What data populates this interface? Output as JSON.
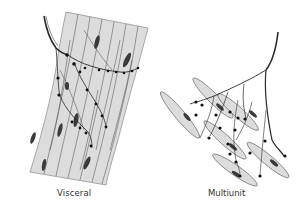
{
  "figure": {
    "panels": [
      {
        "id": "visceral",
        "caption": "Visceral",
        "description": "Sheet of closely packed spindle-shaped smooth muscle fibers with a branching nerve fiber bearing varicosities running across many fibers"
      },
      {
        "id": "multiunit",
        "caption": "Multiunit",
        "description": "Separate discrete smooth muscle fibers each innervated individually by branches of a single nerve fiber ending in varicosities"
      }
    ],
    "colors": {
      "muscle_fill": "#dcdcdc",
      "outline": "#555555",
      "nucleus": "#3a3a3a",
      "nerve": "#2a2a2a",
      "background": "#ffffff"
    }
  }
}
